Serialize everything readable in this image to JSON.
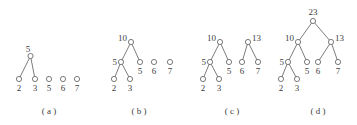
{
  "figure": {
    "background_color": "#ffffff",
    "stroke_color": "#5a5a5a",
    "text_color": "#3d3d3d",
    "node_radius": 2.6,
    "panels": [
      {
        "id": "panel-a",
        "caption": "( a )",
        "caption_x": 49,
        "caption_y": 114,
        "nodes": [
          {
            "name": "a-internal-5",
            "label": "5",
            "cx": 30.5,
            "cy": 56,
            "label_x": 28,
            "label_y": 52,
            "label_anchor": "middle"
          },
          {
            "name": "a-leaf-2",
            "label": "2",
            "cx": 19,
            "cy": 79,
            "label_x": 19,
            "label_y": 91,
            "label_anchor": "middle"
          },
          {
            "name": "a-leaf-3",
            "label": "3",
            "cx": 35,
            "cy": 79,
            "label_x": 35,
            "label_y": 91,
            "label_anchor": "middle"
          },
          {
            "name": "a-leaf-5",
            "label": "5",
            "cx": 49,
            "cy": 79,
            "label_x": 49,
            "label_y": 91,
            "label_anchor": "middle"
          },
          {
            "name": "a-leaf-6",
            "label": "6",
            "cx": 63,
            "cy": 79,
            "label_x": 63,
            "label_y": 91,
            "label_anchor": "middle"
          },
          {
            "name": "a-leaf-7",
            "label": "7",
            "cx": 77,
            "cy": 79,
            "label_x": 77,
            "label_y": 91,
            "label_anchor": "middle"
          }
        ],
        "edges": [
          {
            "name": "a-edge-5-2",
            "x1": 30.5,
            "y1": 56,
            "x2": 19,
            "y2": 79
          },
          {
            "name": "a-edge-5-3",
            "x1": 30.5,
            "y1": 56,
            "x2": 35,
            "y2": 79
          }
        ]
      },
      {
        "id": "panel-b",
        "caption": "( b )",
        "caption_x": 139,
        "caption_y": 114,
        "nodes": [
          {
            "name": "b-internal-10",
            "label": "10",
            "cx": 131,
            "cy": 42,
            "label_x": 127,
            "label_y": 41,
            "label_anchor": "end"
          },
          {
            "name": "b-internal-5",
            "label": "5",
            "cx": 121,
            "cy": 62,
            "label_x": 117,
            "label_y": 65,
            "label_anchor": "end"
          },
          {
            "name": "b-leaf-5",
            "label": "5",
            "cx": 140,
            "cy": 62,
            "label_x": 140,
            "label_y": 74,
            "label_anchor": "middle"
          },
          {
            "name": "b-leaf-6",
            "label": "6",
            "cx": 154,
            "cy": 62,
            "label_x": 154,
            "label_y": 74,
            "label_anchor": "middle"
          },
          {
            "name": "b-leaf-7",
            "label": "7",
            "cx": 170,
            "cy": 62,
            "label_x": 170,
            "label_y": 74,
            "label_anchor": "middle"
          },
          {
            "name": "b-leaf-2",
            "label": "2",
            "cx": 114,
            "cy": 79,
            "label_x": 114,
            "label_y": 91,
            "label_anchor": "middle"
          },
          {
            "name": "b-leaf-3",
            "label": "3",
            "cx": 130,
            "cy": 79,
            "label_x": 130,
            "label_y": 91,
            "label_anchor": "middle"
          }
        ],
        "edges": [
          {
            "name": "b-edge-10-5",
            "x1": 131,
            "y1": 42,
            "x2": 121,
            "y2": 62
          },
          {
            "name": "b-edge-10-l5",
            "x1": 131,
            "y1": 42,
            "x2": 140,
            "y2": 62
          },
          {
            "name": "b-edge-5-2",
            "x1": 121,
            "y1": 62,
            "x2": 114,
            "y2": 79
          },
          {
            "name": "b-edge-5-3",
            "x1": 121,
            "y1": 62,
            "x2": 130,
            "y2": 79
          }
        ]
      },
      {
        "id": "panel-c",
        "caption": "( c )",
        "caption_x": 232,
        "caption_y": 114,
        "nodes": [
          {
            "name": "c-internal-10",
            "label": "10",
            "cx": 220,
            "cy": 42,
            "label_x": 216,
            "label_y": 41,
            "label_anchor": "end"
          },
          {
            "name": "c-internal-13",
            "label": "13",
            "cx": 248,
            "cy": 42,
            "label_x": 252,
            "label_y": 41,
            "label_anchor": "start"
          },
          {
            "name": "c-internal-5",
            "label": "5",
            "cx": 210,
            "cy": 62,
            "label_x": 206,
            "label_y": 65,
            "label_anchor": "end"
          },
          {
            "name": "c-leaf-5",
            "label": "5",
            "cx": 229,
            "cy": 62,
            "label_x": 229,
            "label_y": 74,
            "label_anchor": "middle"
          },
          {
            "name": "c-leaf-6",
            "label": "6",
            "cx": 242,
            "cy": 62,
            "label_x": 242,
            "label_y": 74,
            "label_anchor": "middle"
          },
          {
            "name": "c-leaf-7",
            "label": "7",
            "cx": 258,
            "cy": 62,
            "label_x": 258,
            "label_y": 74,
            "label_anchor": "middle"
          },
          {
            "name": "c-leaf-2",
            "label": "2",
            "cx": 203,
            "cy": 79,
            "label_x": 203,
            "label_y": 91,
            "label_anchor": "middle"
          },
          {
            "name": "c-leaf-3",
            "label": "3",
            "cx": 219,
            "cy": 79,
            "label_x": 219,
            "label_y": 91,
            "label_anchor": "middle"
          }
        ],
        "edges": [
          {
            "name": "c-edge-10-5",
            "x1": 220,
            "y1": 42,
            "x2": 210,
            "y2": 62
          },
          {
            "name": "c-edge-10-l5",
            "x1": 220,
            "y1": 42,
            "x2": 229,
            "y2": 62
          },
          {
            "name": "c-edge-13-6",
            "x1": 248,
            "y1": 42,
            "x2": 242,
            "y2": 62
          },
          {
            "name": "c-edge-13-7",
            "x1": 248,
            "y1": 42,
            "x2": 258,
            "y2": 62
          },
          {
            "name": "c-edge-5-2",
            "x1": 210,
            "y1": 62,
            "x2": 203,
            "y2": 79
          },
          {
            "name": "c-edge-5-3",
            "x1": 210,
            "y1": 62,
            "x2": 219,
            "y2": 79
          }
        ]
      },
      {
        "id": "panel-d",
        "caption": "( d )",
        "caption_x": 318,
        "caption_y": 114,
        "nodes": [
          {
            "name": "d-root-23",
            "label": "23",
            "cx": 313,
            "cy": 21,
            "label_x": 313,
            "label_y": 15,
            "label_anchor": "middle"
          },
          {
            "name": "d-internal-10",
            "label": "10",
            "cx": 298,
            "cy": 42,
            "label_x": 294,
            "label_y": 41,
            "label_anchor": "end"
          },
          {
            "name": "d-internal-13",
            "label": "13",
            "cx": 331,
            "cy": 42,
            "label_x": 335,
            "label_y": 41,
            "label_anchor": "start"
          },
          {
            "name": "d-internal-5",
            "label": "5",
            "cx": 288,
            "cy": 62,
            "label_x": 284,
            "label_y": 65,
            "label_anchor": "end"
          },
          {
            "name": "d-leaf-5",
            "label": "5",
            "cx": 307,
            "cy": 62,
            "label_x": 307,
            "label_y": 74,
            "label_anchor": "middle"
          },
          {
            "name": "d-leaf-6",
            "label": "6",
            "cx": 318,
            "cy": 62,
            "label_x": 318,
            "label_y": 74,
            "label_anchor": "middle"
          },
          {
            "name": "d-leaf-7",
            "label": "7",
            "cx": 338,
            "cy": 62,
            "label_x": 338,
            "label_y": 74,
            "label_anchor": "middle"
          },
          {
            "name": "d-leaf-2",
            "label": "2",
            "cx": 281,
            "cy": 79,
            "label_x": 281,
            "label_y": 91,
            "label_anchor": "middle"
          },
          {
            "name": "d-leaf-3",
            "label": "3",
            "cx": 297,
            "cy": 79,
            "label_x": 297,
            "label_y": 91,
            "label_anchor": "middle"
          }
        ],
        "edges": [
          {
            "name": "d-edge-23-10",
            "x1": 313,
            "y1": 21,
            "x2": 298,
            "y2": 42
          },
          {
            "name": "d-edge-23-13",
            "x1": 313,
            "y1": 21,
            "x2": 331,
            "y2": 42
          },
          {
            "name": "d-edge-10-5",
            "x1": 298,
            "y1": 42,
            "x2": 288,
            "y2": 62
          },
          {
            "name": "d-edge-10-l5",
            "x1": 298,
            "y1": 42,
            "x2": 307,
            "y2": 62
          },
          {
            "name": "d-edge-13-6",
            "x1": 331,
            "y1": 42,
            "x2": 318,
            "y2": 62
          },
          {
            "name": "d-edge-13-7",
            "x1": 331,
            "y1": 42,
            "x2": 338,
            "y2": 62
          },
          {
            "name": "d-edge-5-2",
            "x1": 288,
            "y1": 62,
            "x2": 281,
            "y2": 79
          },
          {
            "name": "d-edge-5-3",
            "x1": 288,
            "y1": 62,
            "x2": 297,
            "y2": 79
          }
        ]
      }
    ]
  }
}
